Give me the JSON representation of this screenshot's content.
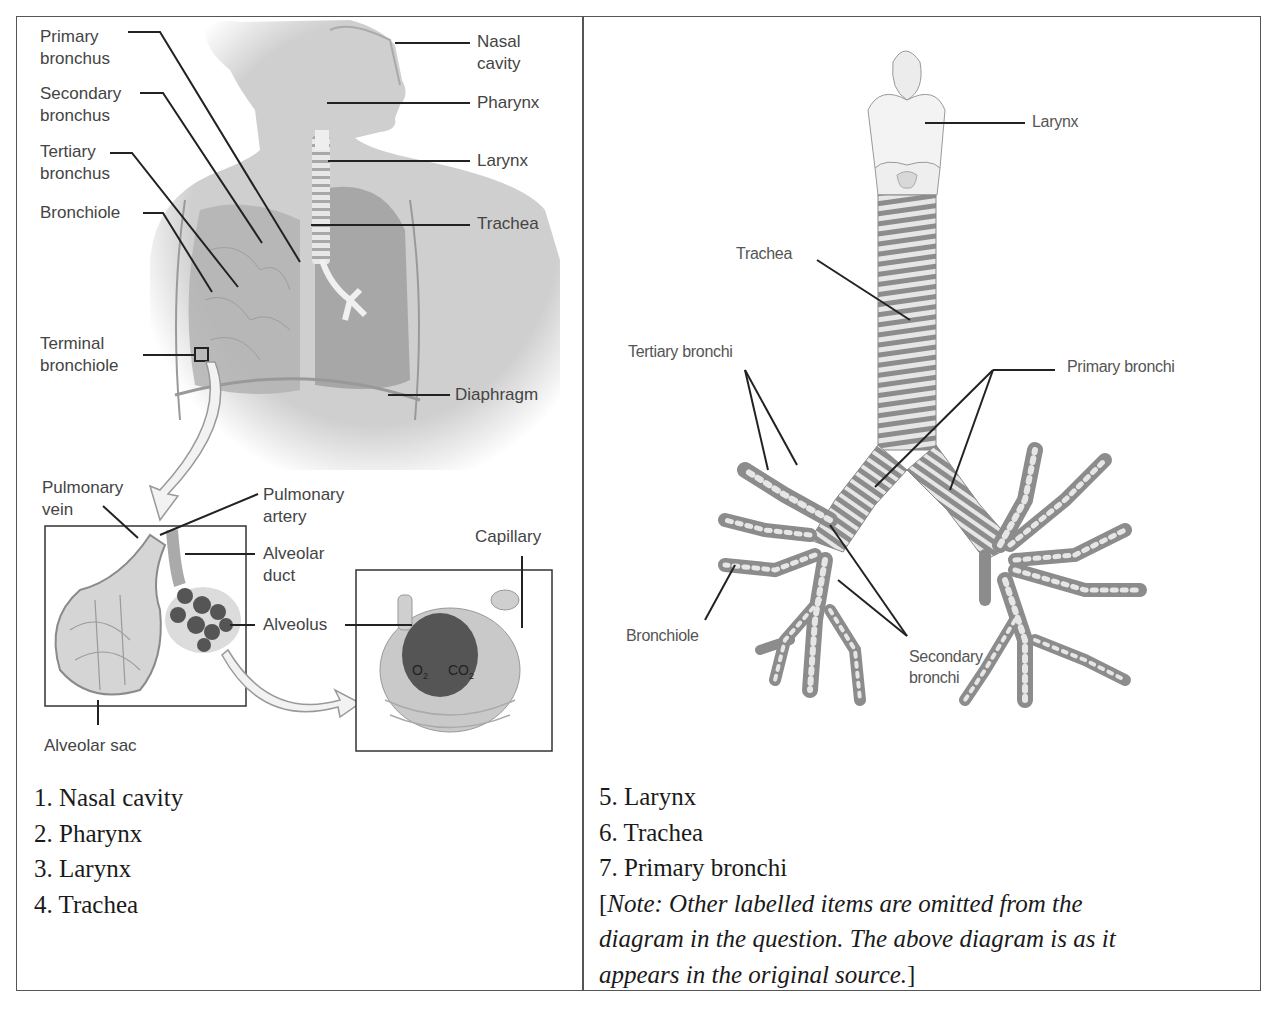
{
  "left_panel": {
    "figure": {
      "labels_left": {
        "primary_bronchus": "Primary\nbronchus",
        "secondary_bronchus": "Secondary\nbronchus",
        "tertiary_bronchus": "Tertiary\nbronchus",
        "bronchiole": "Bronchiole",
        "terminal_bronchiole": "Terminal\nbronchiole"
      },
      "labels_right": {
        "nasal_cavity": "Nasal\ncavity",
        "pharynx": "Pharynx",
        "larynx": "Larynx",
        "trachea": "Trachea",
        "diaphragm": "Diaphragm"
      },
      "labels_inset": {
        "pulmonary_vein": "Pulmonary\nvein",
        "pulmonary_artery": "Pulmonary\nartery",
        "alveolar_duct": "Alveolar\nduct",
        "alveolus": "Alveolus",
        "capillary": "Capillary",
        "alveolar_sac": "Alveolar sac",
        "o2": "O",
        "o2_sub": "2",
        "co2": "CO",
        "co2_sub": "2"
      }
    },
    "list": [
      "1. Nasal cavity",
      "2. Pharynx",
      "3. Larynx",
      "4. Trachea"
    ]
  },
  "right_panel": {
    "figure": {
      "labels": {
        "larynx": "Larynx",
        "trachea": "Trachea",
        "tertiary_bronchi": "Tertiary bronchi",
        "primary_bronchi": "Primary bronchi",
        "bronchiole": "Bronchiole",
        "secondary_bronchi": "Secondary\nbronchi"
      }
    },
    "list": [
      "5. Larynx",
      "6. Trachea",
      "7. Primary bronchi"
    ],
    "note_open": "[",
    "note_line1": "Note: Other labelled items are omitted from the",
    "note_line2": "diagram in the question. The above diagram is as it",
    "note_line3": "appears in the original source.",
    "note_close": "]"
  },
  "colors": {
    "border": "#555555",
    "figure_gray": "#c8c8c8",
    "figure_dark": "#8a8a8a",
    "label_text": "#444444",
    "leader_line": "#222222"
  }
}
